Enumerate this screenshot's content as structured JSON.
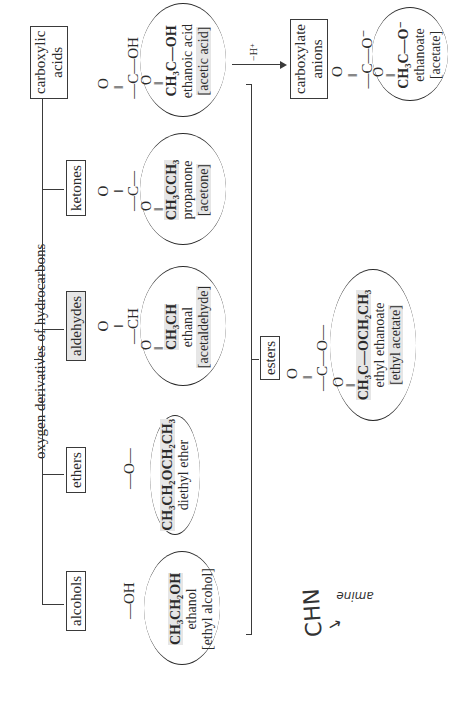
{
  "title": "oxygen derivatives of hydrocarbons",
  "categories": [
    {
      "id": "alcohols",
      "label": "alcohols",
      "group": "—OH",
      "example": {
        "formula": "CH₃CH₂OH",
        "name": "ethanol",
        "common": "[ethyl alcohol]"
      }
    },
    {
      "id": "ethers",
      "label": "ethers",
      "group": "—O—",
      "example": {
        "formula": "CH₃CH₂OCH₂CH₃",
        "name": "diethyl ether",
        "common": ""
      }
    },
    {
      "id": "aldehydes",
      "label": "aldehydes",
      "group_top": "O",
      "group_mid": "‖",
      "group": "—CH",
      "example": {
        "o": "O",
        "bond": "‖",
        "formula": "CH₃CH",
        "name": "ethanal",
        "common": "[acetaldehyde]"
      }
    },
    {
      "id": "ketones",
      "label": "ketones",
      "group_top": "O",
      "group_mid": "‖",
      "group": "—C—",
      "example": {
        "o": "O",
        "bond": "‖",
        "formula": "CH₃CCH₃",
        "name": "propanone",
        "common": "[acetone]"
      }
    },
    {
      "id": "carboxylic",
      "label_line1": "carboxylic",
      "label_line2": "acids",
      "group_top": "O",
      "group_mid": "‖",
      "group": "—C—OH",
      "example": {
        "o": "O",
        "bond": "‖",
        "formula": "CH₃C—OH",
        "name": "ethanoic acid",
        "common": "[acetic acid]"
      }
    }
  ],
  "esters": {
    "label": "esters",
    "group_top": "O",
    "group_mid": "‖",
    "group": "—C—O—",
    "example": {
      "o": "O",
      "bond": "‖",
      "formula": "CH₃C—OCH₂CH₃",
      "name": "ethyl ethanoate",
      "common": "[ethyl acetate]"
    }
  },
  "reaction": {
    "label": "−H⁺"
  },
  "carboxylate": {
    "label_line1": "carboxylate",
    "label_line2": "anions",
    "group_top": "O",
    "group_mid": "‖",
    "group": "—C—O⁻",
    "example": {
      "o": "O",
      "bond": "‖",
      "formula": "CH₃C—O⁻",
      "name": "ethanoate",
      "common": "[acetate]"
    }
  },
  "handwriting": {
    "text1": "CHN",
    "arrow": "→",
    "text2": "amine"
  }
}
